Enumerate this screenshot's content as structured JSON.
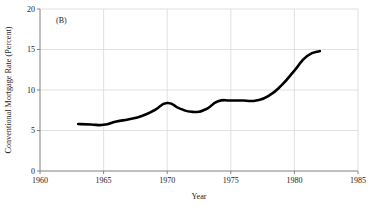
{
  "panel": {
    "label": "(B)"
  },
  "chart_data": {
    "type": "line",
    "title": "",
    "subtitle": "",
    "panel_label": "(B)",
    "xlabel": "Year",
    "ylabel": "Conventional Mortgage Rate (Percent)",
    "xlim": [
      1960,
      1985
    ],
    "ylim": [
      0,
      20
    ],
    "xticks": [
      1960,
      1965,
      1970,
      1975,
      1980,
      1985
    ],
    "xtick_labels": [
      "1960",
      "1965",
      "1970",
      "1975",
      "1980",
      "1985"
    ],
    "yticks": [
      0,
      5,
      10,
      15,
      20
    ],
    "ytick_labels": [
      "0",
      "5",
      "10",
      "15",
      "20"
    ],
    "grid": true,
    "grid_color": "#d9d9d9",
    "legend": false,
    "legend_position": "none",
    "line_color": "#000000",
    "line_width": 2.6,
    "x": [
      1963,
      1964,
      1965,
      1966,
      1967,
      1968,
      1969,
      1970,
      1971,
      1972,
      1973,
      1974,
      1975,
      1976,
      1977,
      1978,
      1979,
      1980,
      1981,
      1982
    ],
    "values": [
      5.8,
      5.75,
      5.7,
      6.1,
      6.4,
      6.8,
      7.5,
      8.4,
      7.7,
      7.3,
      7.6,
      8.6,
      8.7,
      8.7,
      8.7,
      9.3,
      10.6,
      12.4,
      14.2,
      14.8
    ],
    "series": [
      {
        "name": "Conventional Mortgage Rate",
        "x": [
          1963,
          1964,
          1965,
          1966,
          1967,
          1968,
          1969,
          1970,
          1971,
          1972,
          1973,
          1974,
          1975,
          1976,
          1977,
          1978,
          1979,
          1980,
          1981,
          1982
        ],
        "values": [
          5.8,
          5.75,
          5.7,
          6.1,
          6.4,
          6.8,
          7.5,
          8.4,
          7.7,
          7.3,
          7.6,
          8.6,
          8.7,
          8.7,
          8.7,
          9.3,
          10.6,
          12.4,
          14.2,
          14.8
        ]
      }
    ]
  }
}
